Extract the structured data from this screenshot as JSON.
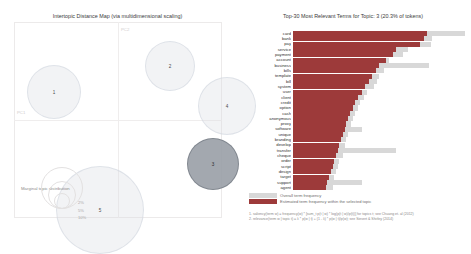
{
  "left_panel": {
    "title": "Intertopic Distance Map (via multidimensional scaling)",
    "axis_x_label": "PC1",
    "axis_y_label": "PC2",
    "marginal_label": "Marginal topic distribution",
    "marginal_sizes": [
      {
        "pct": "2%"
      },
      {
        "pct": "5%"
      },
      {
        "pct": "10%"
      }
    ],
    "topics": [
      {
        "id": "1",
        "label": "1",
        "cx": 40,
        "cy": 70,
        "r": 27,
        "selected": false
      },
      {
        "id": "2",
        "label": "2",
        "cx": 156,
        "cy": 44,
        "r": 25,
        "selected": false
      },
      {
        "id": "4",
        "label": "4",
        "cx": 213,
        "cy": 84,
        "r": 29,
        "selected": false
      },
      {
        "id": "3",
        "label": "3",
        "cx": 199,
        "cy": 142,
        "r": 26,
        "selected": true
      },
      {
        "id": "5",
        "label": "5",
        "cx": 86,
        "cy": 188,
        "r": 44,
        "selected": false
      }
    ]
  },
  "right_panel": {
    "title": "Top-30 Most Relevant Terms for Topic: 3 (20.3% of tokens)",
    "legend": [
      {
        "name": "overall-term-frequency",
        "text": "Overall term frequency",
        "color": "#d8d8d8"
      },
      {
        "name": "estimated-term-frequency",
        "text": "Estimated term frequency within the selected topic",
        "color": "#9d3a3a"
      }
    ],
    "footnotes": [
      "1. saliency(term w) = frequency(w) * [sum_t p(t | w) * log(p(t | w)/p(t))] for topics t; see Chuang et. al (2012)",
      "2. relevance(term w | topic t) = λ * p(w | t) + (1 - λ) * p(w | t)/p(w); see Sievert & Shirley (2014)"
    ]
  },
  "chart_data": {
    "type": "bar",
    "title": "Top-30 Most Relevant Terms for Topic: 3 (20.3% of tokens)",
    "xlabel": "",
    "ylabel": "",
    "orientation": "horizontal",
    "legend_position": "bottom",
    "grid": false,
    "xlim": [
      0,
      100
    ],
    "categories": [
      "card",
      "bank",
      "pay",
      "service",
      "payment",
      "account",
      "business",
      "bills",
      "template",
      "bill",
      "system",
      "user",
      "client",
      "credit",
      "option",
      "cash",
      "anonymous",
      "proxy",
      "software",
      "unique",
      "branding",
      "develop",
      "transfer",
      "cheque",
      "order",
      "script",
      "design",
      "target",
      "support",
      "agent"
    ],
    "series": [
      {
        "name": "Overall term frequency",
        "color": "#d8d8d8",
        "values": [
          100,
          81,
          80,
          67,
          64,
          56,
          79,
          53,
          50,
          49,
          47,
          43,
          41,
          39,
          38,
          36,
          35,
          34,
          40,
          32,
          31,
          30,
          60,
          29,
          27,
          26,
          25,
          24,
          40,
          23
        ]
      },
      {
        "name": "Estimated term frequency within the selected topic",
        "color": "#9d3a3a",
        "values": [
          78,
          76,
          74,
          60,
          58,
          54,
          50,
          48,
          46,
          44,
          42,
          40,
          38,
          36,
          35,
          33,
          32,
          31,
          30,
          29,
          28,
          27,
          26,
          25,
          24,
          23,
          22,
          21,
          20,
          19
        ]
      }
    ]
  }
}
